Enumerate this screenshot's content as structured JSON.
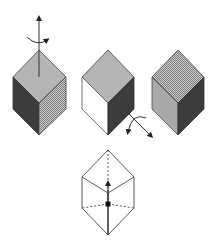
{
  "diagram": {
    "colors": {
      "background": "#ffffff",
      "top_light": "#b4b4b4",
      "dark": "#3c3c3c",
      "mid_gray": "#a0a0a0",
      "white_face": "#ffffff",
      "stroke": "#333333",
      "hatch_light": "#d0d0d0",
      "hatch_dark": "#8a8a8a"
    },
    "cubes": [
      {
        "id": "cube-1",
        "faces": {
          "top": "light-gray",
          "left": "dark",
          "right": "crosshatch"
        },
        "rotation_axis": "vertical-up",
        "cx": 39
      },
      {
        "id": "cube-2",
        "faces": {
          "top": "light-gray",
          "left": "white",
          "right": "dark"
        },
        "rotation_axis": "diagonal-down-right",
        "cx": 108
      },
      {
        "id": "cube-3",
        "faces": {
          "top": "crosshatch",
          "left": "light-gray",
          "right": "dark"
        },
        "rotation_axis": "none",
        "cx": 178
      }
    ],
    "wireframe": {
      "id": "wireframe-cube",
      "axis": "body-diagonal",
      "hidden_vertex_marker": "dot"
    }
  }
}
